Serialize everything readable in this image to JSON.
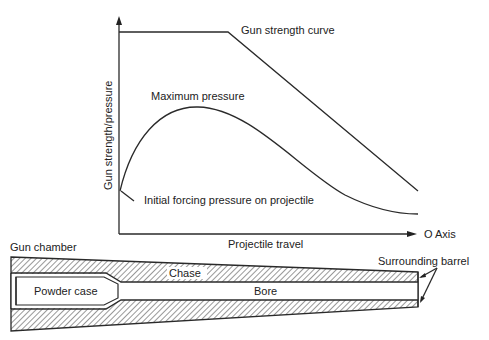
{
  "chart": {
    "y_axis_label": "Gun strength/pressure",
    "x_axis_label": "Projectile travel",
    "x_axis_end_label": "O Axis",
    "curves": {
      "gun_strength": "Gun strength curve",
      "max_pressure": "Maximum pressure",
      "initial_forcing": "Initial forcing pressure on projectile"
    }
  },
  "barrel": {
    "gun_chamber": "Gun chamber",
    "powder_case": "Powder case",
    "chase": "Chase",
    "bore": "Bore",
    "surrounding_barrel": "Surrounding barrel"
  }
}
